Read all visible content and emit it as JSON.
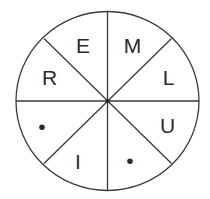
{
  "diagram": {
    "type": "letter-wheel",
    "segments": 8,
    "center_dot": true,
    "line_color": "#3a3a3a",
    "text_color": "#2a2a2a",
    "labels": [
      {
        "position": "top-left",
        "text": "E"
      },
      {
        "position": "top-right",
        "text": "M"
      },
      {
        "position": "right-upper",
        "text": "L"
      },
      {
        "position": "right-lower",
        "text": "U"
      },
      {
        "position": "bottom-right",
        "text": "•"
      },
      {
        "position": "bottom-left",
        "text": "I"
      },
      {
        "position": "left-lower",
        "text": "•"
      },
      {
        "position": "left-upper",
        "text": "R"
      }
    ]
  }
}
